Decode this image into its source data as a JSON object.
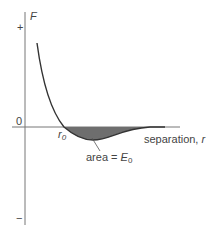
{
  "diagram": {
    "y_axis": {
      "label": "F",
      "plus": "+",
      "minus": "−",
      "zero": "0"
    },
    "x_axis": {
      "label": "separation, ",
      "var": "r"
    },
    "equilibrium": {
      "symbol": "r",
      "sub": "0"
    },
    "annotation": {
      "text": "area = ",
      "symbol": "E",
      "sub": "0"
    },
    "colors": {
      "curve": "#333333",
      "axis": "#666666",
      "fill": "#6e6e6e",
      "text": "#444444"
    }
  }
}
